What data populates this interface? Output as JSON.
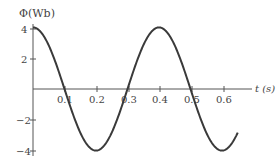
{
  "chart_data": {
    "type": "line",
    "title": "",
    "xlabel": "t (s)",
    "ylabel": "Φ(Wb)",
    "x_ticks": [
      "0.1",
      "0.2",
      "0.3",
      "0.4",
      "0.5",
      "0.6"
    ],
    "y_ticks": [
      "4",
      "2",
      "-2",
      "-4"
    ],
    "xlim": [
      0,
      0.68
    ],
    "ylim": [
      -4,
      4
    ],
    "grid": false,
    "series": [
      {
        "name": "Φ(t)",
        "function": "4cos(5πt)",
        "x": [
          0,
          0.05,
          0.1,
          0.15,
          0.2,
          0.25,
          0.3,
          0.35,
          0.4,
          0.45,
          0.5,
          0.55,
          0.6,
          0.65
        ],
        "values": [
          4,
          2.83,
          0,
          -2.83,
          -4,
          -2.83,
          0,
          2.83,
          4,
          2.83,
          0,
          -2.83,
          -4,
          -2.83
        ]
      }
    ]
  },
  "labels": {
    "y_axis": "Φ(Wb)",
    "x_axis": "t (s)",
    "xt": [
      "0.1",
      "0.2",
      "0.3",
      "0.4",
      "0.5",
      "0.6"
    ],
    "yt": [
      "4",
      "2",
      "−2",
      "−4"
    ]
  }
}
